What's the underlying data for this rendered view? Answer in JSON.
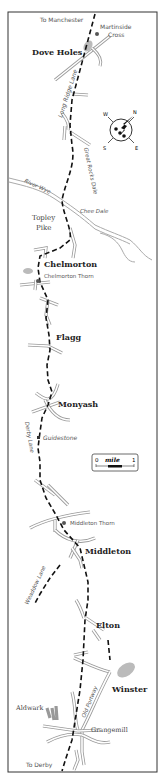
{
  "map": {
    "title": "Route map: Martinside Cross to Grangemill",
    "directions": {
      "north_exit": "To Manchester",
      "south_exit": "To Derby"
    },
    "places": [
      {
        "name": "Dove Holes",
        "type": "village"
      },
      {
        "name": "Topley Pike",
        "type": "village"
      },
      {
        "name": "Chelmorton",
        "type": "village"
      },
      {
        "name": "Flagg",
        "type": "village"
      },
      {
        "name": "Monyash",
        "type": "village"
      },
      {
        "name": "Middleton",
        "type": "village"
      },
      {
        "name": "Elton",
        "type": "village"
      },
      {
        "name": "Winster",
        "type": "village"
      },
      {
        "name": "Aldwark",
        "type": "hamlet"
      },
      {
        "name": "Grangemill",
        "type": "hamlet"
      }
    ],
    "landmarks": [
      {
        "name": "Martinside Cross",
        "line1": "Martinside",
        "line2": "Cross"
      },
      {
        "name": "Chelmorton Thorn"
      },
      {
        "name": "Guidestone"
      },
      {
        "name": "Middleton Thorn"
      }
    ],
    "features": {
      "long_ridge_lane": "Long Ridge Lane",
      "great_rocks_dale": "Great Rocks Dale",
      "river_wye": "River Wye",
      "chee_dale": "Chee Dale",
      "derby_lane": "Derby Lane",
      "weaddow_lane": "Weaddow Lane",
      "old_portway": "Old Portway"
    },
    "compass": {
      "n": "N",
      "e": "E",
      "s": "S",
      "w": "W"
    },
    "scale": {
      "start": "0",
      "unit": "mile",
      "end": "1"
    },
    "colors": {
      "route": "#111111",
      "road_outline": "#999999",
      "river": "#aaaaaa",
      "frame": "#333333"
    }
  }
}
